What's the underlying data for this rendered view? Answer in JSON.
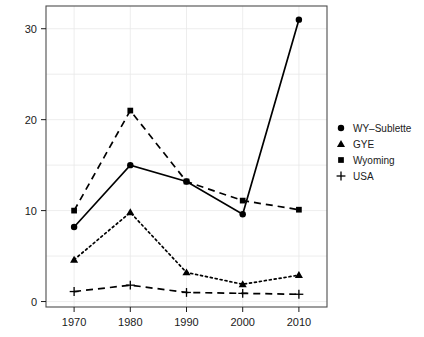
{
  "chart_data": {
    "type": "line",
    "title": "",
    "subtitle": "",
    "xlabel": "",
    "ylabel": "",
    "x": [
      1970,
      1980,
      1990,
      2000,
      2010
    ],
    "xtick_labels": [
      "1970",
      "1980",
      "1990",
      "2000",
      "2010"
    ],
    "ytick_labels": [
      "0",
      "10",
      "20",
      "30"
    ],
    "ytick_values": [
      0,
      10,
      20,
      30
    ],
    "xlim": [
      1965,
      2015
    ],
    "ylim": [
      -0.6,
      32.5
    ],
    "grid": true,
    "legend_position": "right",
    "series": [
      {
        "name": "WY-Sublette",
        "marker": "circle",
        "linestyle": "solid",
        "values": [
          8.2,
          15.0,
          13.2,
          9.6,
          31.0
        ]
      },
      {
        "name": "GYE",
        "marker": "triangle",
        "linestyle": "dotted",
        "values": [
          4.6,
          9.8,
          3.2,
          1.9,
          2.9
        ]
      },
      {
        "name": "Wyoming",
        "marker": "square",
        "linestyle": "dashed",
        "values": [
          10.0,
          21.0,
          13.2,
          11.1,
          10.1
        ]
      },
      {
        "name": "USA",
        "marker": "plus",
        "linestyle": "dashed",
        "values": [
          1.1,
          1.8,
          1.0,
          0.9,
          0.8
        ]
      }
    ]
  },
  "legend": {
    "entries": [
      {
        "label": "WY–Sublette",
        "marker": "circle"
      },
      {
        "label": "GYE",
        "marker": "triangle"
      },
      {
        "label": "Wyoming",
        "marker": "square"
      },
      {
        "label": "USA",
        "marker": "plus"
      }
    ]
  },
  "colors": {
    "foreground": "#000000",
    "frame": "#4d4d4d",
    "grid": "#e9e9e9",
    "background": "#ffffff"
  }
}
